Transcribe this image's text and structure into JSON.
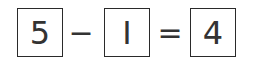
{
  "equation": {
    "operand1": "5",
    "operator": "−",
    "operand2": "I",
    "equals": "=",
    "result": "4"
  },
  "colors": {
    "border": "#2a2a2a",
    "text": "#333333",
    "background": "#ffffff"
  }
}
